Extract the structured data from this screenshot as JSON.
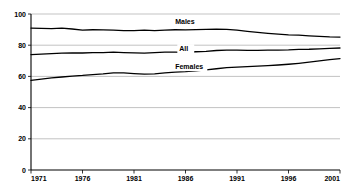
{
  "chart_data": {
    "type": "line",
    "title": "",
    "subtitle": "",
    "xlabel": "",
    "ylabel": "",
    "xlim": [
      1971,
      2001
    ],
    "ylim": [
      0,
      100
    ],
    "grid": true,
    "legend_position": "inline-annotations",
    "x": [
      1971,
      1972,
      1973,
      1974,
      1975,
      1976,
      1977,
      1978,
      1979,
      1980,
      1981,
      1982,
      1983,
      1984,
      1985,
      1986,
      1987,
      1988,
      1989,
      1990,
      1991,
      1992,
      1993,
      1994,
      1995,
      1996,
      1997,
      1998,
      1999,
      2000,
      2001
    ],
    "xticklabels": [
      "1971",
      "1976",
      "1981",
      "1986",
      "1991",
      "1996",
      "2001"
    ],
    "xticks": [
      1971,
      1976,
      1981,
      1986,
      1991,
      1996,
      2001
    ],
    "yticklabels": [
      "0",
      "20",
      "40",
      "60",
      "80",
      "100"
    ],
    "yticks": [
      0,
      20,
      40,
      60,
      80,
      100
    ],
    "series": [
      {
        "name": "Males",
        "label": "Males",
        "color": "#000000",
        "label_x": 1985.0,
        "label_y": 93.5,
        "values": [
          91.0,
          90.8,
          90.6,
          90.9,
          90.4,
          89.7,
          89.9,
          89.8,
          89.6,
          89.4,
          89.3,
          89.6,
          89.4,
          89.6,
          89.9,
          89.8,
          90.0,
          90.2,
          90.3,
          90.2,
          89.6,
          88.9,
          88.2,
          87.6,
          87.1,
          86.6,
          86.4,
          86.0,
          85.6,
          85.3,
          85.2
        ]
      },
      {
        "name": "All",
        "label": "All",
        "color": "#000000",
        "label_x": 1985.4,
        "label_y": 76.5,
        "values": [
          74.0,
          74.3,
          74.6,
          74.9,
          75.1,
          75.0,
          75.3,
          75.2,
          75.6,
          75.3,
          75.1,
          74.9,
          75.3,
          75.6,
          75.5,
          75.4,
          75.8,
          76.1,
          76.6,
          76.9,
          76.8,
          76.7,
          76.7,
          76.8,
          76.9,
          77.0,
          77.3,
          77.4,
          77.7,
          78.0,
          78.2
        ]
      },
      {
        "name": "Females",
        "label": "Females",
        "color": "#000000",
        "label_x": 1985.0,
        "label_y": 65.0,
        "values": [
          57.5,
          58.3,
          59.0,
          59.6,
          60.2,
          60.6,
          61.2,
          61.6,
          62.3,
          62.3,
          61.8,
          61.4,
          61.6,
          62.2,
          62.7,
          63.0,
          63.6,
          64.2,
          64.9,
          65.6,
          66.0,
          66.3,
          66.6,
          66.9,
          67.3,
          67.8,
          68.4,
          69.1,
          69.9,
          70.7,
          71.4
        ]
      }
    ]
  },
  "axis": {
    "y_tick_labels": [
      "100",
      "80",
      "60",
      "40",
      "20",
      "0"
    ],
    "x_tick_labels": [
      "1971",
      "1976",
      "1981",
      "1986",
      "1991",
      "1996",
      "2001"
    ]
  }
}
